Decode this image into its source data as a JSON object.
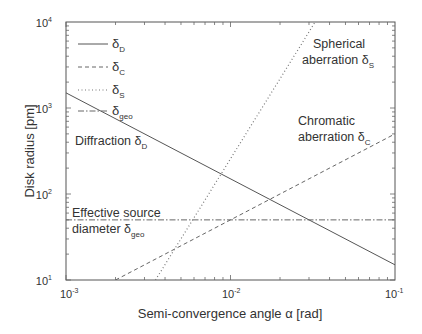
{
  "chart_data": {
    "type": "line",
    "title": "",
    "xlabel": "Semi-convergence angle α [rad]",
    "ylabel": "Disk radius [pm]",
    "xscale": "log",
    "yscale": "log",
    "xlim": [
      0.001,
      0.1
    ],
    "ylim": [
      10,
      10000
    ],
    "x_ticks": [
      {
        "base": "10",
        "exp": "-3"
      },
      {
        "base": "10",
        "exp": "-2"
      },
      {
        "base": "10",
        "exp": "-1"
      }
    ],
    "y_ticks": [
      {
        "base": "10",
        "exp": "1"
      },
      {
        "base": "10",
        "exp": "2"
      },
      {
        "base": "10",
        "exp": "3"
      },
      {
        "base": "10",
        "exp": "4"
      }
    ],
    "grid": false,
    "legend_position": "upper left",
    "series": [
      {
        "name": "δD",
        "symbol": "δ",
        "subscript": "D",
        "style": "solid",
        "x": [
          0.001,
          0.1
        ],
        "y": [
          1500,
          15
        ]
      },
      {
        "name": "δC",
        "symbol": "δ",
        "subscript": "C",
        "style": "dashed",
        "x": [
          0.002,
          0.1
        ],
        "y": [
          10,
          500
        ]
      },
      {
        "name": "δS",
        "symbol": "δ",
        "subscript": "S",
        "style": "dotted",
        "x": [
          0.0035,
          0.0327
        ],
        "y": [
          10,
          10000
        ]
      },
      {
        "name": "δgeo",
        "symbol": "δ",
        "subscript": "geo",
        "style": "dash-dot",
        "x": [
          0.001,
          0.1
        ],
        "y": [
          50,
          50
        ]
      }
    ],
    "annotations": [
      {
        "id": "diffraction",
        "text": "Diffraction δ",
        "sub": "D"
      },
      {
        "id": "spherical_1",
        "text": "Spherical"
      },
      {
        "id": "spherical_2",
        "text": "aberration δ",
        "sub": "S"
      },
      {
        "id": "chromatic_1",
        "text": "Chromatic"
      },
      {
        "id": "chromatic_2",
        "text": "aberration δ",
        "sub": "C"
      },
      {
        "id": "geo_1",
        "text": "Effective source"
      },
      {
        "id": "geo_2",
        "text": "diameter δ",
        "sub": "geo"
      }
    ]
  }
}
